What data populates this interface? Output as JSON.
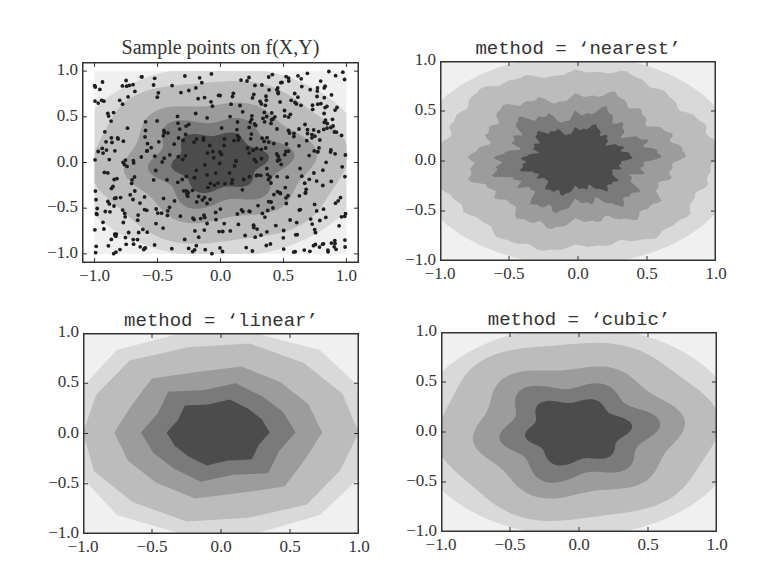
{
  "figure": {
    "layout": "2x2 subplots",
    "colormap": "grayscale filled contours"
  },
  "chart_data": [
    {
      "type": "scatter+contour",
      "title": "Sample points on f(X,Y)",
      "xlabel": "",
      "ylabel": "",
      "xlim": [
        -1.1,
        1.1
      ],
      "ylim": [
        -1.1,
        1.1
      ],
      "xticks": [
        "−1.0",
        "−0.5",
        "0.0",
        "0.5",
        "1.0"
      ],
      "yticks": [
        "1.0",
        "0.5",
        "0.0",
        "−0.5",
        "−1.0"
      ],
      "scatter_points_count": 500,
      "grid": false,
      "frame": {
        "x": 82,
        "y": 62,
        "w": 277,
        "h": 201
      }
    },
    {
      "type": "contour",
      "title": "method = ‘nearest’",
      "xlim": [
        -1.0,
        1.0
      ],
      "ylim": [
        -1.0,
        1.0
      ],
      "xticks": [
        "−1.0",
        "−0.5",
        "0.0",
        "0.5",
        "1.0"
      ],
      "yticks": [
        "1.0",
        "0.5",
        "0.0",
        "−0.5",
        "−1.0"
      ],
      "style": "jagged",
      "grid": false,
      "frame": {
        "x": 440,
        "y": 61,
        "w": 276,
        "h": 200
      }
    },
    {
      "type": "contour",
      "title": "method = ‘linear’",
      "xlim": [
        -1.0,
        1.0
      ],
      "ylim": [
        -1.0,
        1.0
      ],
      "xticks": [
        "−1.0",
        "−0.5",
        "0.0",
        "0.5",
        "1.0"
      ],
      "yticks": [
        "1.0",
        "0.5",
        "0.0",
        "−0.5",
        "−1.0"
      ],
      "style": "polygonal",
      "grid": false,
      "frame": {
        "x": 83,
        "y": 333,
        "w": 276,
        "h": 201
      }
    },
    {
      "type": "contour",
      "title": "method = ‘cubic’",
      "xlim": [
        -1.0,
        1.0
      ],
      "ylim": [
        -1.0,
        1.0
      ],
      "xticks": [
        "−1.0",
        "−0.5",
        "0.0",
        "0.5",
        "1.0"
      ],
      "yticks": [
        "1.0",
        "0.5",
        "0.0",
        "−0.5",
        "−1.0"
      ],
      "style": "smooth",
      "grid": false,
      "frame": {
        "x": 441,
        "y": 332,
        "w": 276,
        "h": 200
      }
    }
  ],
  "contour_levels": {
    "colors": [
      "#f0f0f0",
      "#d9d9d9",
      "#bcbcbc",
      "#9c9c9c",
      "#7a7a7a",
      "#4c4c4c"
    ],
    "radii": [
      1.0,
      0.85,
      0.62,
      0.45,
      0.3
    ]
  }
}
